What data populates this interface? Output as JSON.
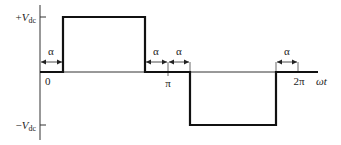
{
  "diagram": {
    "y_axis": {
      "pos_label_sign": "+",
      "pos_label_v": "V",
      "pos_label_sub": "dc",
      "neg_label_sign": "−",
      "neg_label_v": "V",
      "neg_label_sub": "dc"
    },
    "x_axis": {
      "origin_label": "0",
      "pi_label": "π",
      "two_pi_label": "2π",
      "axis_label": "ωt"
    },
    "angle_markers": [
      {
        "label": "α",
        "position": "0 to α"
      },
      {
        "label": "α",
        "position": "π−α to π"
      },
      {
        "label": "α",
        "position": "π to π+α"
      },
      {
        "label": "α",
        "position": "2π−α to 2π"
      }
    ],
    "colors": {
      "waveform": "#111111",
      "axis": "#333333",
      "background": "#ffffff"
    }
  }
}
